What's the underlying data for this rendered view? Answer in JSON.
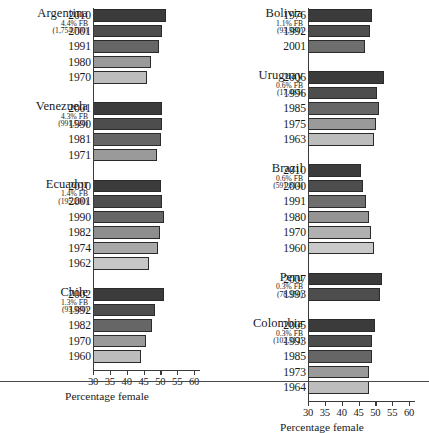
{
  "axis": {
    "title": "Percentage female",
    "ticks": [
      30,
      35,
      40,
      45,
      50,
      55,
      60
    ],
    "min": 30,
    "max": 60
  },
  "chart_data": {
    "type": "bar",
    "title": "",
    "subtitle": "",
    "xlabel": "Percentage female",
    "ylabel": "",
    "xlim": [
      30,
      60
    ],
    "grid": false,
    "legend": false,
    "orientation": "horizontal",
    "tick_labels": [
      "30",
      "35",
      "40",
      "45",
      "50",
      "55",
      "60"
    ],
    "note": "Each country group lists census years; bar length is percentage female among the foreign born. Shade darkens with more recent year.",
    "panels": [
      {
        "panel": "left",
        "groups": [
          {
            "country": "Argentina",
            "fb_percent": "4.4% FB",
            "fb_count": "(1,754,700)",
            "categories": [
              "2010",
              "2001",
              "1991",
              "1980",
              "1970"
            ],
            "values": [
              51.7,
              50.6,
              49.6,
              47.3,
              46.1
            ],
            "shades": [
              "#3b3b3b",
              "#4d4d4d",
              "#666666",
              "#9a9a9a",
              "#bdbdbd"
            ]
          },
          {
            "country": "Venezuela",
            "fb_percent": "4.3% FB",
            "fb_count": "(991,520)",
            "categories": [
              "2001",
              "1990",
              "1981",
              "1971"
            ],
            "values": [
              50.6,
              50.4,
              50.2,
              48.9
            ],
            "shades": [
              "#3b3b3b",
              "#4d4d4d",
              "#666666",
              "#9a9a9a"
            ]
          },
          {
            "country": "Ecuador",
            "fb_percent": "1.4% FB",
            "fb_count": "(195,200)",
            "categories": [
              "2010",
              "2001",
              "1990",
              "1982",
              "1974",
              "1962"
            ],
            "values": [
              50.2,
              50.6,
              51.1,
              49.9,
              49.4,
              46.5
            ],
            "shades": [
              "#3b3b3b",
              "#4d4d4d",
              "#666666",
              "#8e8e8e",
              "#a8a8a8",
              "#c6c6c6"
            ]
          },
          {
            "country": "Chile",
            "fb_percent": "1.3% FB",
            "fb_count": "(93,380)",
            "categories": [
              "2002",
              "1992",
              "1982",
              "1970",
              "1960"
            ],
            "values": [
              51.1,
              48.5,
              47.6,
              45.6,
              44.3
            ],
            "shades": [
              "#3b3b3b",
              "#4d4d4d",
              "#666666",
              "#9a9a9a",
              "#bdbdbd"
            ]
          }
        ]
      },
      {
        "panel": "right",
        "groups": [
          {
            "country": "Bolivia",
            "fb_percent": "1.1% FB",
            "fb_count": "(93,380)",
            "categories": [
              "1976",
              "1992",
              "2001"
            ],
            "values": [
              49.1,
              48.5,
              47.0
            ],
            "shades": [
              "#3b3b3b",
              "#4d4d4d",
              "#6e6e6e"
            ]
          },
          {
            "country": "Uruguay",
            "fb_percent": "0.6% FB",
            "fb_count": "(17,465)",
            "categories": [
              "2006",
              "1996",
              "1985",
              "1975",
              "1963"
            ],
            "values": [
              52.6,
              50.6,
              51.0,
              50.2,
              49.7
            ],
            "shades": [
              "#3b3b3b",
              "#4d4d4d",
              "#666666",
              "#9a9a9a",
              "#bdbdbd"
            ]
          },
          {
            "country": "Brazil",
            "fb_percent": "0.6% FB",
            "fb_count": "(591,814)",
            "categories": [
              "2010",
              "2000",
              "1991",
              "1980",
              "1970",
              "1960"
            ],
            "values": [
              45.6,
              46.2,
              47.3,
              48.2,
              48.8,
              49.7
            ],
            "shades": [
              "#3b3b3b",
              "#4d4d4d",
              "#6e6e6e",
              "#949494",
              "#b0b0b0",
              "#c9c9c9"
            ]
          },
          {
            "country": "Peru",
            "fb_percent": "0.3% FB",
            "fb_count": "(78,350)",
            "categories": [
              "2007",
              "1993"
            ],
            "values": [
              52.0,
              51.5
            ],
            "shades": [
              "#3b3b3b",
              "#4d4d4d"
            ]
          },
          {
            "country": "Colombia",
            "fb_percent": "0.3% FB",
            "fb_count": "(102,312)",
            "categories": [
              "2005",
              "1993",
              "1985",
              "1973",
              "1964"
            ],
            "values": [
              49.9,
              49.1,
              49.1,
              48.2,
              48.0
            ],
            "shades": [
              "#3b3b3b",
              "#4d4d4d",
              "#666666",
              "#9a9a9a",
              "#bdbdbd"
            ]
          }
        ]
      }
    ]
  }
}
